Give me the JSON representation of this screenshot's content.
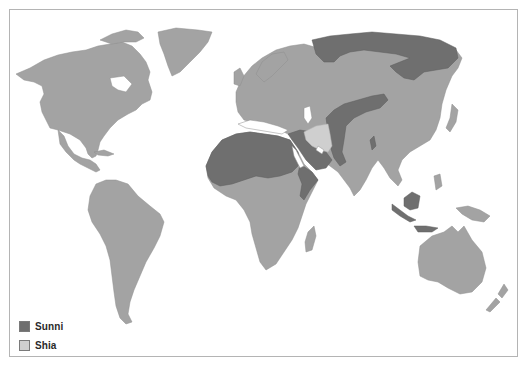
{
  "map": {
    "title": "World distribution of Sunni and Shia Islam",
    "colors": {
      "sunni": "#6f6f6f",
      "shia": "#cfcfcf",
      "other_land": "#a3a3a3",
      "water": "#ffffff",
      "frame": "#b4b4b4"
    }
  },
  "legend": {
    "items": [
      {
        "label": "Sunni",
        "color": "#6f6f6f"
      },
      {
        "label": "Shia",
        "color": "#cfcfcf"
      }
    ]
  }
}
